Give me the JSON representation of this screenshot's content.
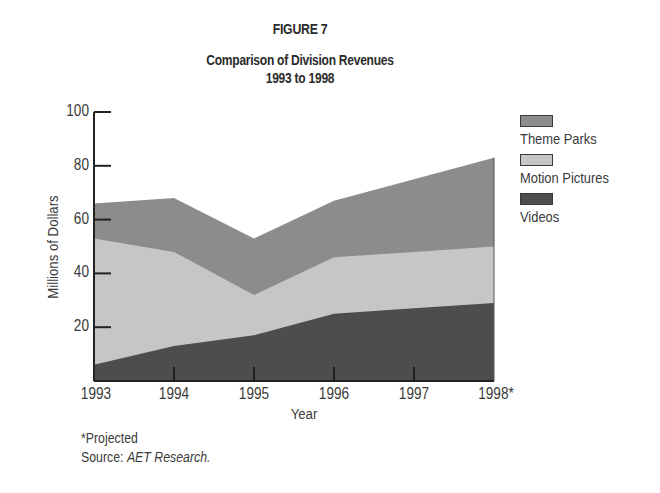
{
  "figure_label": "FIGURE 7",
  "title_line1": "Comparison of Division Revenues",
  "title_line2": "1993 to 1998",
  "y_axis": {
    "label": "Millions of Dollars",
    "ticks": [
      "100",
      "80",
      "60",
      "40",
      "20"
    ]
  },
  "x_axis": {
    "label": "Year",
    "ticks": [
      "1993",
      "1994",
      "1995",
      "1996",
      "1997",
      "1998*"
    ]
  },
  "legend": [
    {
      "label": "Theme Parks",
      "color": "#8c8c8c"
    },
    {
      "label": "Motion Pictures",
      "color": "#c6c6c6"
    },
    {
      "label": "Videos",
      "color": "#4d4d4d"
    }
  ],
  "footnote": "*Projected",
  "source_prefix": "Source: ",
  "source_name": "AET Research.",
  "chart_data": {
    "type": "area",
    "stacked": true,
    "supertitle": "FIGURE 7",
    "xlabel": "Year",
    "ylabel": "Millions of Dollars",
    "categories": [
      "1993",
      "1994",
      "1995",
      "1996",
      "1997",
      "1998*"
    ],
    "ylim": [
      0,
      100
    ],
    "yticks": [
      20,
      40,
      60,
      80,
      100
    ],
    "grid": false,
    "legend_position": "right",
    "series": [
      {
        "name": "Videos",
        "values": [
          6,
          13,
          17,
          25,
          27,
          29
        ],
        "cumulative_top": [
          6,
          13,
          17,
          25,
          27,
          29
        ]
      },
      {
        "name": "Motion Pictures",
        "values": [
          47,
          35,
          15,
          21,
          21,
          21
        ],
        "cumulative_top": [
          53,
          48,
          32,
          46,
          48,
          50
        ]
      },
      {
        "name": "Theme Parks",
        "values": [
          13,
          20,
          21,
          21,
          27,
          33
        ],
        "cumulative_top": [
          66,
          68,
          53,
          67,
          75,
          83
        ]
      }
    ],
    "annotations": [
      "*Projected",
      "Source: AET Research."
    ]
  }
}
